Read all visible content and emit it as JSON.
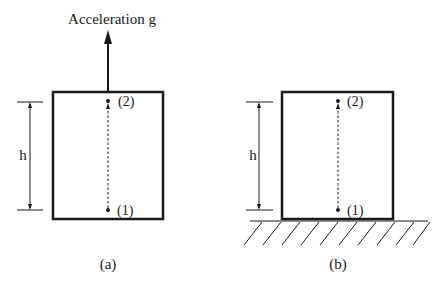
{
  "figure": {
    "panel_a": {
      "caption": "(a)",
      "acceleration_label": "Acceleration g",
      "dimension_label": "h",
      "point_top_label": "(2)",
      "point_bottom_label": "(1)"
    },
    "panel_b": {
      "caption": "(b)",
      "dimension_label": "h",
      "point_top_label": "(2)",
      "point_bottom_label": "(1)"
    },
    "colors": {
      "stroke": "#1a1a1a",
      "background": "#ffffff"
    }
  }
}
